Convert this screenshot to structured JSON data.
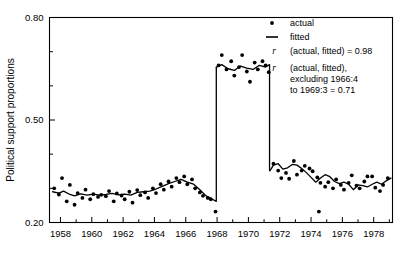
{
  "chart_data": {
    "type": "scatter",
    "title": "",
    "xlabel": "",
    "ylabel": "Political support proportions",
    "xlim": [
      1957.3,
      1979.2
    ],
    "ylim": [
      0.2,
      0.8
    ],
    "grid": false,
    "x_major_ticks": [
      1958,
      1960,
      1962,
      1964,
      1966,
      1968,
      1970,
      1972,
      1974,
      1976,
      1978
    ],
    "x_major_tick_labels": [
      "1958",
      "1960",
      "1962",
      "1964",
      "1966",
      "1968",
      "1970",
      "1972",
      "1974",
      "1976",
      "1978"
    ],
    "x_minor_ticks": [
      1959,
      1961,
      1963,
      1965,
      1967,
      1969,
      1971,
      1973,
      1975,
      1977,
      1979
    ],
    "y_major_ticks": [
      0.2,
      0.5,
      0.8
    ],
    "y_major_tick_labels": [
      "0.20",
      "0.50",
      "0.80"
    ],
    "y_minor_ticks": [
      0.3,
      0.4,
      0.6,
      0.7
    ],
    "legend_position": "top-right",
    "series": [
      {
        "name": "actual",
        "type": "scatter",
        "marker": "dot",
        "color": "#000000",
        "points": [
          [
            1957.6,
            0.3
          ],
          [
            1957.9,
            0.282
          ],
          [
            1958.1,
            0.33
          ],
          [
            1958.4,
            0.262
          ],
          [
            1958.6,
            0.31
          ],
          [
            1958.9,
            0.252
          ],
          [
            1959.1,
            0.286
          ],
          [
            1959.4,
            0.272
          ],
          [
            1959.6,
            0.296
          ],
          [
            1959.9,
            0.268
          ],
          [
            1960.1,
            0.283
          ],
          [
            1960.4,
            0.275
          ],
          [
            1960.6,
            0.281
          ],
          [
            1960.9,
            0.277
          ],
          [
            1961.1,
            0.292
          ],
          [
            1961.4,
            0.262
          ],
          [
            1961.6,
            0.285
          ],
          [
            1961.9,
            0.279
          ],
          [
            1962.1,
            0.268
          ],
          [
            1962.4,
            0.29
          ],
          [
            1962.6,
            0.258
          ],
          [
            1962.9,
            0.295
          ],
          [
            1963.1,
            0.28
          ],
          [
            1963.4,
            0.288
          ],
          [
            1963.6,
            0.272
          ],
          [
            1963.9,
            0.3
          ],
          [
            1964.1,
            0.286
          ],
          [
            1964.4,
            0.312
          ],
          [
            1964.6,
            0.296
          ],
          [
            1964.9,
            0.32
          ],
          [
            1965.1,
            0.305
          ],
          [
            1965.4,
            0.33
          ],
          [
            1965.6,
            0.318
          ],
          [
            1965.9,
            0.335
          ],
          [
            1966.1,
            0.312
          ],
          [
            1966.4,
            0.326
          ],
          [
            1966.6,
            0.3
          ],
          [
            1966.9,
            0.288
          ],
          [
            1967.1,
            0.278
          ],
          [
            1967.4,
            0.272
          ],
          [
            1967.6,
            0.268
          ],
          [
            1967.9,
            0.232
          ],
          [
            1968.1,
            0.66
          ],
          [
            1968.3,
            0.69
          ],
          [
            1968.6,
            0.648
          ],
          [
            1968.9,
            0.672
          ],
          [
            1969.1,
            0.63
          ],
          [
            1969.4,
            0.655
          ],
          [
            1969.6,
            0.69
          ],
          [
            1969.9,
            0.642
          ],
          [
            1970.1,
            0.612
          ],
          [
            1970.4,
            0.668
          ],
          [
            1970.6,
            0.648
          ],
          [
            1970.9,
            0.672
          ],
          [
            1971.1,
            0.66
          ],
          [
            1971.3,
            0.64
          ],
          [
            1971.6,
            0.372
          ],
          [
            1971.9,
            0.352
          ],
          [
            1972.1,
            0.33
          ],
          [
            1972.4,
            0.345
          ],
          [
            1972.6,
            0.328
          ],
          [
            1972.9,
            0.38
          ],
          [
            1973.1,
            0.34
          ],
          [
            1973.4,
            0.352
          ],
          [
            1973.6,
            0.366
          ],
          [
            1973.9,
            0.358
          ],
          [
            1974.1,
            0.35
          ],
          [
            1974.4,
            0.332
          ],
          [
            1974.6,
            0.316
          ],
          [
            1974.9,
            0.305
          ],
          [
            1975.1,
            0.318
          ],
          [
            1975.4,
            0.3
          ],
          [
            1975.6,
            0.326
          ],
          [
            1975.9,
            0.31
          ],
          [
            1976.1,
            0.296
          ],
          [
            1976.4,
            0.316
          ],
          [
            1976.6,
            0.338
          ],
          [
            1976.9,
            0.308
          ],
          [
            1977.1,
            0.3
          ],
          [
            1977.4,
            0.32
          ],
          [
            1977.6,
            0.335
          ],
          [
            1977.9,
            0.335
          ],
          [
            1978.1,
            0.302
          ],
          [
            1978.4,
            0.292
          ],
          [
            1978.6,
            0.31
          ],
          [
            1978.9,
            0.33
          ],
          [
            1974.5,
            0.232
          ]
        ]
      },
      {
        "name": "fitted",
        "type": "line",
        "color": "#000000",
        "points": [
          [
            1957.5,
            0.29
          ],
          [
            1957.9,
            0.286
          ],
          [
            1958.2,
            0.292
          ],
          [
            1958.6,
            0.282
          ],
          [
            1958.9,
            0.278
          ],
          [
            1959.3,
            0.284
          ],
          [
            1959.7,
            0.28
          ],
          [
            1960.1,
            0.283
          ],
          [
            1960.5,
            0.28
          ],
          [
            1960.9,
            0.282
          ],
          [
            1961.3,
            0.285
          ],
          [
            1961.7,
            0.281
          ],
          [
            1962.1,
            0.283
          ],
          [
            1962.5,
            0.28
          ],
          [
            1962.9,
            0.288
          ],
          [
            1963.3,
            0.29
          ],
          [
            1963.7,
            0.292
          ],
          [
            1964.1,
            0.298
          ],
          [
            1964.5,
            0.306
          ],
          [
            1964.9,
            0.314
          ],
          [
            1965.3,
            0.32
          ],
          [
            1965.7,
            0.326
          ],
          [
            1966.1,
            0.318
          ],
          [
            1966.5,
            0.312
          ],
          [
            1966.9,
            0.296
          ],
          [
            1967.3,
            0.278
          ],
          [
            1967.7,
            0.268
          ],
          [
            1967.95,
            0.262
          ],
          [
            1967.97,
            0.655
          ],
          [
            1968.3,
            0.662
          ],
          [
            1968.7,
            0.65
          ],
          [
            1969.1,
            0.645
          ],
          [
            1969.5,
            0.658
          ],
          [
            1969.9,
            0.652
          ],
          [
            1970.3,
            0.648
          ],
          [
            1970.7,
            0.66
          ],
          [
            1971.1,
            0.655
          ],
          [
            1971.35,
            0.662
          ],
          [
            1971.38,
            0.352
          ],
          [
            1971.6,
            0.368
          ],
          [
            1971.9,
            0.372
          ],
          [
            1972.2,
            0.356
          ],
          [
            1972.5,
            0.36
          ],
          [
            1972.8,
            0.37
          ],
          [
            1973.1,
            0.368
          ],
          [
            1973.4,
            0.358
          ],
          [
            1973.7,
            0.346
          ],
          [
            1974.0,
            0.332
          ],
          [
            1974.3,
            0.318
          ],
          [
            1974.6,
            0.33
          ],
          [
            1974.9,
            0.34
          ],
          [
            1975.2,
            0.334
          ],
          [
            1975.5,
            0.32
          ],
          [
            1975.8,
            0.314
          ],
          [
            1976.1,
            0.318
          ],
          [
            1976.4,
            0.312
          ],
          [
            1976.7,
            0.296
          ],
          [
            1977.0,
            0.31
          ],
          [
            1977.3,
            0.308
          ],
          [
            1977.6,
            0.304
          ],
          [
            1977.9,
            0.312
          ],
          [
            1978.2,
            0.318
          ],
          [
            1978.5,
            0.312
          ],
          [
            1978.8,
            0.322
          ],
          [
            1979.1,
            0.33
          ]
        ]
      }
    ],
    "legend": [
      {
        "marker": "dot",
        "label": "actual"
      },
      {
        "marker": "line",
        "label": "fitted"
      },
      {
        "marker": "none",
        "symbol": "r",
        "label": "(actual, fitted) = 0.98"
      },
      {
        "marker": "none",
        "symbol": "r",
        "label_lines": [
          "(actual, fitted),",
          "excluding 1966:4",
          "to 1969:3  =  0.71"
        ]
      }
    ]
  }
}
